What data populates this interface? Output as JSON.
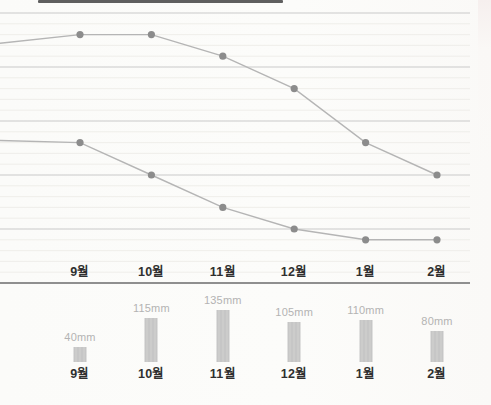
{
  "page": {
    "colors": {
      "paper": "#fcfcfa",
      "grid_major": "#c9c9c9",
      "grid_minor": "#edece9",
      "axis": "#8f8f8f",
      "line": "#b5b5b5",
      "dot": "#8c8c8c",
      "bar": "#c6c6c6",
      "value_label": "#b3b3b3",
      "month_label": "#2f2f2f",
      "cropped_edge": "#5f5f5f"
    }
  },
  "chart_data": [
    {
      "type": "line",
      "title": "",
      "categories": [
        "9월",
        "10월",
        "11월",
        "12월",
        "1월",
        "2월"
      ],
      "series": [
        {
          "name": "upper-line",
          "values": [
            23,
            23,
            21,
            18,
            13,
            10
          ],
          "left_edge_value": 22.2
        },
        {
          "name": "lower-line",
          "values": [
            13,
            10,
            7,
            5,
            4,
            4
          ],
          "left_edge_value": 13.2
        }
      ],
      "ylim": [
        0,
        25
      ],
      "y_axis_labels_visible": false,
      "grid": {
        "major_step": 5,
        "minor_step": 1,
        "grid_on": true
      },
      "legend": "none"
    },
    {
      "type": "bar",
      "title": "",
      "categories": [
        "9월",
        "10월",
        "11월",
        "12월",
        "1월",
        "2월"
      ],
      "values": [
        40,
        115,
        135,
        105,
        110,
        80
      ],
      "value_labels": [
        "40mm",
        "115mm",
        "135mm",
        "105mm",
        "110mm",
        "80mm"
      ],
      "unit": "mm",
      "ylim": [
        0,
        135
      ]
    }
  ]
}
